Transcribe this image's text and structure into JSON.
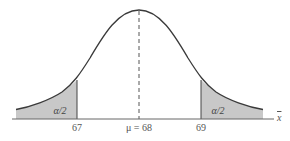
{
  "figure": {
    "type": "normal-distribution-diagram",
    "axis_label": "x",
    "axis_label_note": "x-bar (sample mean)",
    "mean_label": "μ = 68",
    "ticks": [
      {
        "value": 67,
        "label": "67"
      },
      {
        "value": 68,
        "label": "μ = 68"
      },
      {
        "value": 69,
        "label": "69"
      }
    ],
    "left_tail_label": "α/2",
    "right_tail_label": "α/2",
    "shaded_color": "#c8c8c8",
    "curve_color": "#3a3a3a"
  }
}
